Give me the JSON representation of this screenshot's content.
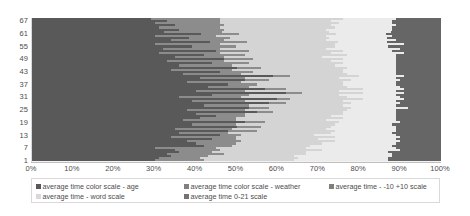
{
  "chart": {
    "type": "bar",
    "title": "",
    "subtitle": ""
  },
  "xaxis": {
    "label": "",
    "ticks": [
      "0%",
      "10%",
      "20%",
      "30%",
      "40%",
      "50%",
      "60%",
      "70%",
      "80%",
      "90%",
      "100%"
    ]
  },
  "yaxis": {
    "label": "",
    "ticks": [
      "67",
      "61",
      "55",
      "49",
      "43",
      "37",
      "31",
      "25",
      "19",
      "13",
      "7",
      "1"
    ]
  },
  "legend": {
    "position": "bottom",
    "items": [
      {
        "label": "average time color scale - age",
        "color": "#595959"
      },
      {
        "label": "average time color scale - weather",
        "color": "#808080"
      },
      {
        "label": "average time - -10 +10 scale",
        "color": "#7f7f7f"
      },
      {
        "label": "average time - word scale",
        "color": "#d9d9d9"
      },
      {
        "label": "average time 0-21 scale",
        "color": "#737373"
      }
    ]
  },
  "colors": {
    "series1": "#595959",
    "series2": "#8c8c8c",
    "series3": "#d4d4d4",
    "series4": "#ebebeb",
    "series5": "#666666",
    "plot_background": "#f2f2f2",
    "axis_text": "#4d4d4d",
    "gridline": "#d9d9d9"
  },
  "chart_data": {
    "type": "bar",
    "orientation": "horizontal",
    "stacked": true,
    "normalized": "100%",
    "title": "",
    "xlabel": "",
    "ylabel": "",
    "xlim": [
      0,
      100
    ],
    "grid": false,
    "legend_position": "bottom",
    "categories": [
      "1",
      "2",
      "3",
      "4",
      "5",
      "6",
      "7",
      "8",
      "9",
      "10",
      "11",
      "12",
      "13",
      "14",
      "15",
      "16",
      "17",
      "18",
      "19",
      "20",
      "21",
      "22",
      "23",
      "24",
      "25",
      "26",
      "27",
      "28",
      "29",
      "30",
      "31",
      "32",
      "33",
      "34",
      "35",
      "36",
      "37",
      "38",
      "39",
      "40",
      "41",
      "42",
      "43",
      "44",
      "45",
      "46",
      "47",
      "48",
      "49",
      "50",
      "51",
      "52",
      "53",
      "54",
      "55",
      "56",
      "57",
      "58",
      "59",
      "60",
      "61",
      "62",
      "63",
      "64",
      "65",
      "66",
      "67",
      "68"
    ],
    "series": [
      {
        "name": "average time color scale - age",
        "color": "#595959",
        "values": [
          30,
          31,
          34,
          33,
          36,
          35,
          30,
          42,
          40,
          38,
          44,
          34,
          46,
          36,
          48,
          35,
          50,
          39,
          52,
          37,
          41,
          45,
          40,
          55,
          38,
          53,
          42,
          58,
          39,
          60,
          36,
          44,
          62,
          40,
          57,
          43,
          48,
          38,
          52,
          41,
          59,
          37,
          46,
          34,
          50,
          36,
          44,
          33,
          47,
          35,
          42,
          31,
          45,
          32,
          39,
          30,
          43,
          34,
          38,
          30,
          40,
          32,
          36,
          31,
          35,
          30,
          33,
          29
        ]
      },
      {
        "name": "average time color scale - weather",
        "color": "#8c8c8c",
        "values": [
          12,
          10,
          9,
          14,
          8,
          11,
          15,
          7,
          10,
          13,
          6,
          16,
          5,
          12,
          7,
          14,
          6,
          11,
          5,
          13,
          9,
          7,
          12,
          4,
          14,
          5,
          11,
          4,
          13,
          3,
          15,
          9,
          4,
          12,
          5,
          10,
          7,
          13,
          6,
          11,
          4,
          14,
          8,
          15,
          6,
          13,
          9,
          14,
          7,
          12,
          10,
          15,
          8,
          14,
          11,
          16,
          9,
          13,
          10,
          15,
          9,
          14,
          11,
          15,
          12,
          16,
          13,
          17
        ]
      },
      {
        "name": "average time - -10 +10 scale",
        "color": "#d4d4d4",
        "values": [
          22,
          24,
          21,
          20,
          23,
          25,
          22,
          19,
          21,
          23,
          20,
          24,
          18,
          25,
          19,
          23,
          17,
          24,
          18,
          22,
          26,
          21,
          24,
          17,
          25,
          20,
          23,
          16,
          24,
          18,
          26,
          22,
          15,
          23,
          19,
          24,
          21,
          25,
          20,
          23,
          17,
          26,
          22,
          27,
          21,
          25,
          23,
          26,
          22,
          24,
          25,
          27,
          23,
          26,
          24,
          28,
          22,
          25,
          24,
          27,
          23,
          26,
          25,
          28,
          26,
          29,
          27,
          30
        ]
      },
      {
        "name": "average time - word scale",
        "color": "#ebebeb",
        "values": [
          23,
          22,
          24,
          21,
          20,
          19,
          22,
          20,
          18,
          16,
          19,
          16,
          20,
          15,
          15,
          17,
          16,
          14,
          15,
          17,
          13,
          16,
          13,
          13,
          12,
          14,
          13,
          12,
          13,
          10,
          13,
          14,
          10,
          14,
          10,
          13,
          13,
          13,
          12,
          14,
          11,
          12,
          13,
          13,
          12,
          15,
          13,
          16,
          13,
          18,
          12,
          18,
          12,
          18,
          13,
          17,
          12,
          17,
          14,
          16,
          12,
          15,
          16,
          14,
          16,
          13,
          15,
          13
        ]
      },
      {
        "name": "average time 0-21 scale",
        "color": "#666666",
        "values": [
          13,
          13,
          12,
          12,
          13,
          10,
          11,
          12,
          11,
          10,
          11,
          10,
          11,
          12,
          11,
          11,
          11,
          12,
          10,
          11,
          11,
          11,
          11,
          11,
          11,
          8,
          11,
          10,
          11,
          9,
          10,
          11,
          9,
          11,
          9,
          10,
          11,
          11,
          10,
          11,
          9,
          11,
          11,
          11,
          11,
          11,
          11,
          11,
          11,
          11,
          11,
          9,
          12,
          10,
          13,
          9,
          13,
          11,
          13,
          12,
          13,
          12,
          12,
          12,
          11,
          12,
          12,
          11
        ]
      }
    ]
  }
}
